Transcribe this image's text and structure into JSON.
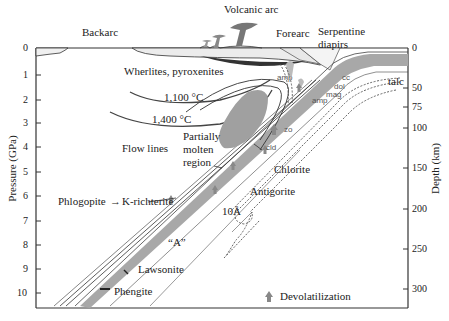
{
  "figure": {
    "type": "subduction-zone cross-section diagram",
    "left_axis": {
      "label": "Pressure (GPa)",
      "ticks": [
        {
          "v": "0",
          "y": 48
        },
        {
          "v": "1",
          "y": 75
        },
        {
          "v": "2",
          "y": 100
        },
        {
          "v": "3",
          "y": 123
        },
        {
          "v": "4",
          "y": 147
        },
        {
          "v": "5",
          "y": 172
        },
        {
          "v": "6",
          "y": 196
        },
        {
          "v": "7",
          "y": 221
        },
        {
          "v": "8",
          "y": 245
        },
        {
          "v": "9",
          "y": 269
        },
        {
          "v": "10",
          "y": 293
        }
      ]
    },
    "right_axis": {
      "label": "Depth (km)",
      "ticks": [
        {
          "v": "0",
          "y": 48
        },
        {
          "v": "50",
          "y": 88
        },
        {
          "v": "75",
          "y": 107
        },
        {
          "v": "100",
          "y": 128
        },
        {
          "v": "150",
          "y": 168
        },
        {
          "v": "200",
          "y": 209
        },
        {
          "v": "250",
          "y": 249
        },
        {
          "v": "300",
          "y": 289
        }
      ]
    },
    "top_labels": {
      "backarc": "Backarc",
      "volcanic_arc": "Volcanic arc",
      "forearc": "Forearc",
      "serpentine_1": "Serpentine",
      "serpentine_2": "diapirs"
    },
    "labels": {
      "wherlites": "Wherlites, pyroxenites",
      "iso1100": "1,100 °C",
      "iso1400": "1,400 °C",
      "flow_lines": "Flow lines",
      "partially": "Partially",
      "molten": "molten",
      "region": "region",
      "phlogopite": "Phlogopite",
      "arrow": "→",
      "krichterite": "K-richterite",
      "chlorite": "Chlorite",
      "antigorite": "Antigorite",
      "tenA": "10Å",
      "phaseA": "“A”",
      "lawsonite": "Lawsonite",
      "phengite": "Phengite",
      "talc": "talc",
      "amp1": "amp",
      "amp2": "amp",
      "cc": "cc",
      "dol": "dol",
      "mag": "mag",
      "zo": "zo",
      "cld": "cld"
    },
    "legend": {
      "icon": "up-arrow-icon",
      "label": "Devolatilization"
    },
    "colors": {
      "slab": "#a8a8a8",
      "molten": "#a0a0a0",
      "lines": "#333333",
      "dashed": "#555555"
    }
  }
}
